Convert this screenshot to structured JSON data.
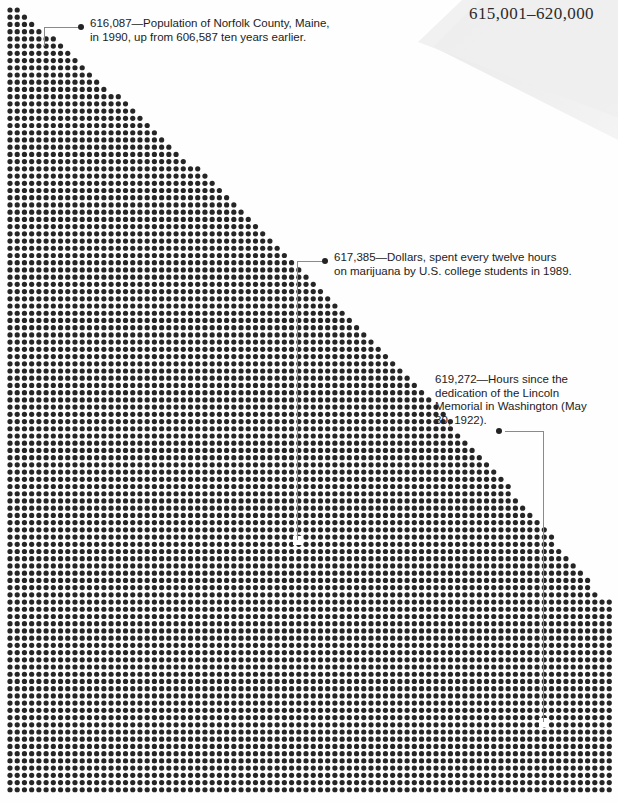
{
  "header": {
    "range_label": "615,001–620,000"
  },
  "dot_field": {
    "description": "dot-grid quadrant",
    "dot_color": "#262626",
    "background_color": "#ffffff",
    "spacing_px": 7.22,
    "dot_diameter_px": 5.2,
    "origin_x": 10,
    "origin_y": 10,
    "columns": 84,
    "rows": 109
  },
  "callouts": [
    {
      "id": "callout-1",
      "value": "616,087",
      "text": "616,087—Population of Norfolk County, Maine, in 1990, up from 606,587 ten years earlier.",
      "bullet_x": 81,
      "bullet_y": 27,
      "leader": {
        "h_from_x": 44,
        "h_to_x": 78,
        "y": 27,
        "v_from_y": 27,
        "v_to_y": 46
      }
    },
    {
      "id": "callout-2",
      "value": "617,385",
      "text": "617,385—Dollars, spent every twelve hours on marijuana by U.S. college students in 1989.",
      "bullet_x": 325,
      "bullet_y": 261,
      "leader": {
        "h_from_x": 297,
        "h_to_x": 322,
        "y": 261,
        "v_from_y": 261,
        "v_to_y": 540
      }
    },
    {
      "id": "callout-3",
      "value": "619,272",
      "text": "619,272—Hours since the dedication of the Lincoln Memorial in Washington (May 30, 1922).",
      "bullet_x": 499,
      "bullet_y": 431,
      "leader": {
        "h_from_x": 505,
        "h_to_x": 543,
        "y": 431,
        "v_from_y": 431,
        "v_to_y": 722
      }
    }
  ],
  "colors": {
    "dot": "#262626",
    "text": "#1c1c1c",
    "leader_line": "#8a8a8a",
    "fold_shade": "#eeeeee",
    "header_text": "#2b2b2b"
  }
}
